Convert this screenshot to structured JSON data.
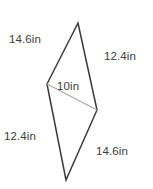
{
  "figure": {
    "type": "geometry-diagram",
    "shape_name": "kite",
    "background_color": "#ffffff",
    "outline_color": "#3a3a3a",
    "diagonal_color": "#a8a8a8",
    "text_color": "#3d3d3d",
    "vertices": {
      "top": [
        78,
        23
      ],
      "left": [
        47,
        84
      ],
      "right": [
        97,
        110
      ],
      "bottom": [
        66,
        180
      ]
    },
    "outline_path": "M 78 23 L 47 84 L 66 180 L 97 110 Z",
    "diagonal_path": "M 47 84 L 97 110",
    "labels": {
      "top_left": "14.6in",
      "top_right": "12.4in",
      "diagonal": "10in",
      "bottom_left": "12.4in",
      "bottom_right": "14.6in"
    }
  }
}
